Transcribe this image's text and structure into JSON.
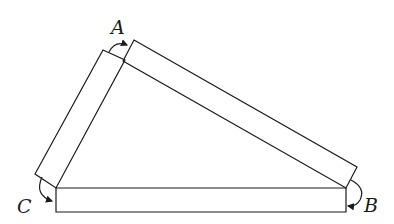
{
  "diagram": {
    "labels": {
      "A": "A",
      "B": "B",
      "C": "C"
    },
    "colors": {
      "stroke": "#1a1a1a",
      "background": "#ffffff"
    }
  }
}
